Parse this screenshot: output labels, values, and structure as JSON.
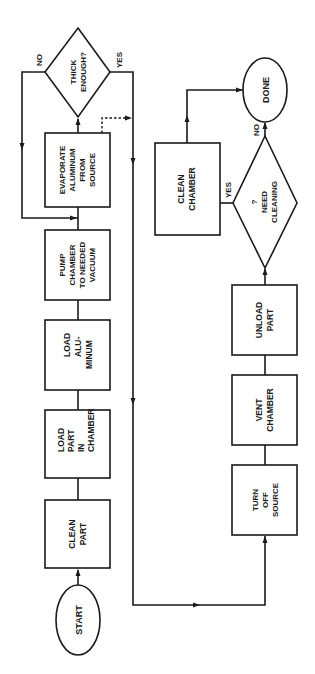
{
  "diagram": {
    "type": "flowchart",
    "orientation": "rotated-90-ccw",
    "colors": {
      "stroke": "#1a1a1a",
      "background": "#ffffff"
    },
    "nodes": {
      "start": {
        "shape": "ellipse",
        "lines": [
          "START"
        ]
      },
      "clean_part": {
        "shape": "rect",
        "lines": [
          "CLEAN",
          "PART"
        ]
      },
      "load_part": {
        "shape": "rect",
        "lines": [
          "LOAD",
          "PART",
          "IN",
          "CHAMBER"
        ]
      },
      "load_aluminum": {
        "shape": "rect",
        "lines": [
          "LOAD",
          "ALU-",
          "MINUM"
        ]
      },
      "pump_chamber": {
        "shape": "rect",
        "lines": [
          "PUMP",
          "CHAMBER",
          "TO NEEDED",
          "VACUUM"
        ]
      },
      "evaporate": {
        "shape": "rect",
        "lines": [
          "EVAPORATE",
          "ALUMINUM",
          "FROM",
          "SOURCE"
        ]
      },
      "thick_enough": {
        "shape": "diamond",
        "lines": [
          "THICK",
          "ENOUGH?"
        ]
      },
      "turn_off_source": {
        "shape": "rect",
        "lines": [
          "TURN",
          "OFF",
          "SOURCE"
        ]
      },
      "vent_chamber": {
        "shape": "rect",
        "lines": [
          "VENT",
          "CHAMBER"
        ]
      },
      "unload_part": {
        "shape": "rect",
        "lines": [
          "UNLOAD",
          "PART"
        ]
      },
      "need_cleaning": {
        "shape": "diamond",
        "lines": [
          "?",
          "NEED",
          "CLEANING"
        ]
      },
      "clean_chamber": {
        "shape": "rect",
        "lines": [
          "CLEAN",
          "CHAMBER"
        ]
      },
      "done": {
        "shape": "ellipse",
        "lines": [
          "DONE"
        ]
      }
    },
    "edge_labels": {
      "thick_no": "NO",
      "thick_yes": "YES",
      "clean_yes": "YES",
      "clean_no": "NO"
    },
    "edges": [
      {
        "from": "start",
        "to": "clean_part"
      },
      {
        "from": "clean_part",
        "to": "load_part"
      },
      {
        "from": "load_part",
        "to": "load_aluminum"
      },
      {
        "from": "load_aluminum",
        "to": "pump_chamber"
      },
      {
        "from": "pump_chamber",
        "to": "evaporate"
      },
      {
        "from": "evaporate",
        "to": "thick_enough"
      },
      {
        "from": "thick_enough",
        "to": "evaporate",
        "label": "NO"
      },
      {
        "from": "thick_enough",
        "to": "turn_off_source",
        "label": "YES"
      },
      {
        "from": "evaporate",
        "to": "turn_off_source",
        "style": "dashed"
      },
      {
        "from": "turn_off_source",
        "to": "vent_chamber"
      },
      {
        "from": "vent_chamber",
        "to": "unload_part"
      },
      {
        "from": "unload_part",
        "to": "need_cleaning"
      },
      {
        "from": "need_cleaning",
        "to": "clean_chamber",
        "label": "YES"
      },
      {
        "from": "need_cleaning",
        "to": "done",
        "label": "NO"
      },
      {
        "from": "clean_chamber",
        "to": "done"
      }
    ]
  }
}
